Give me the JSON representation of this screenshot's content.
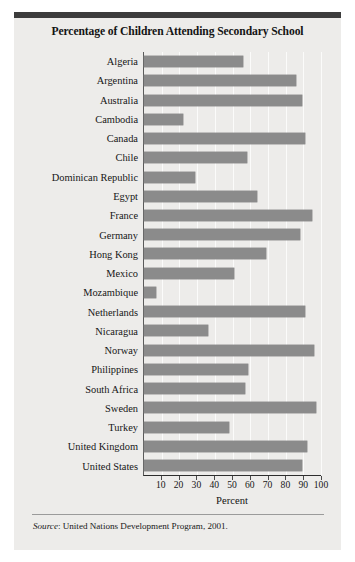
{
  "figure": {
    "title": "Percentage of Children Attending Secondary School",
    "source_prefix": "Source",
    "source_text": ": United Nations Development Program, 2001.",
    "accent_rule_color": "#3c3c3c",
    "bar_color": "#8b8b8b",
    "panel_color": "#edecea"
  },
  "chart_data": {
    "type": "bar",
    "orientation": "horizontal",
    "title": "Percentage of Children Attending Secondary School",
    "xlabel": "Percent",
    "ylabel": "",
    "xlim": [
      0,
      100
    ],
    "xticks": [
      10,
      20,
      30,
      40,
      50,
      60,
      70,
      80,
      90,
      100
    ],
    "xticklabels": [
      "10",
      "20",
      "30",
      "40",
      "50",
      "60",
      "70",
      "80",
      "90",
      "100"
    ],
    "grid": true,
    "grid_axis": "x",
    "legend": null,
    "source": "Source: United Nations Development Program, 2001.",
    "categories": [
      "Algeria",
      "Argentina",
      "Australia",
      "Cambodia",
      "Canada",
      "Chile",
      "Dominican Republic",
      "Egypt",
      "France",
      "Germany",
      "Hong Kong",
      "Mexico",
      "Mozambique",
      "Netherlands",
      "Nicaragua",
      "Norway",
      "Philippines",
      "South Africa",
      "Sweden",
      "Turkey",
      "United Kingdom",
      "United States"
    ],
    "values": [
      56,
      86,
      89,
      22,
      91,
      58,
      29,
      64,
      95,
      88,
      69,
      51,
      7,
      91,
      36,
      96,
      59,
      57,
      97,
      48,
      92,
      89
    ]
  }
}
